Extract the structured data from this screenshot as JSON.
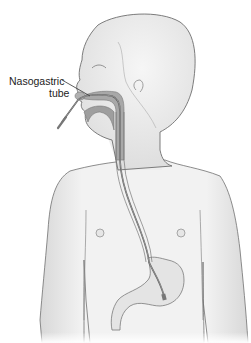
{
  "figure": {
    "label": {
      "line1": "Nasogastric",
      "line2": "tube"
    },
    "colors": {
      "skin": "#f0f0f0",
      "outline": "#6e6e6e",
      "airway": "#9a9a9a",
      "tube": "#5a5a5a",
      "stomach": "#e2e2e2",
      "background": "#ffffff"
    }
  }
}
